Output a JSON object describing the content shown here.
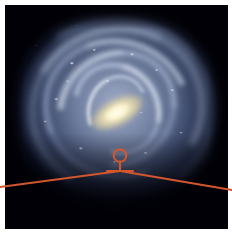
{
  "figure": {
    "name": "milky-way-galaxy-illustration",
    "width": 232,
    "height": 234,
    "background_color": "#ffffff",
    "panel_color": "#000006",
    "caption": ""
  },
  "galaxy": {
    "label": "Milky Way galaxy (face-on artist's impression)",
    "disk_color": "#a8bae0",
    "arm_color": "#dceaff",
    "bulge_color": "#faf0c4",
    "core_color": "#fffff4",
    "center": {
      "x": 116,
      "y": 109
    },
    "disk_radius_x": 104,
    "disk_radius_y": 98,
    "bar_angle_deg": -28,
    "arms": [
      {
        "name": "outer-arm",
        "rotation_deg": 8,
        "opacity": 0.3
      },
      {
        "name": "perseus-arm",
        "rotation_deg": -16,
        "opacity": 0.5
      },
      {
        "name": "outer-sagittarius-arm",
        "rotation_deg": 22,
        "opacity": 0.56
      },
      {
        "name": "sagittarius-arm",
        "rotation_deg": -42,
        "opacity": 0.62
      },
      {
        "name": "scutum-centaurus-arm",
        "rotation_deg": 58,
        "opacity": 0.66
      },
      {
        "name": "norma-arm",
        "rotation_deg": -70,
        "opacity": 0.62
      }
    ]
  },
  "annotation": {
    "marker_color": "#d2562e",
    "marker_label": "",
    "sun_marker": {
      "name": "sun-position-marker",
      "circle": {
        "cx": 120,
        "cy": 155.5,
        "r": 6.3
      },
      "stem": {
        "x": 120,
        "y1": 161.5,
        "y2": 171
      },
      "crossbar": {
        "x1": 107,
        "x2": 133,
        "y": 171
      }
    },
    "sight_lines": [
      {
        "name": "sight-line-left",
        "x1": 120,
        "y1": 171,
        "x2": 0,
        "y2": 187
      },
      {
        "name": "sight-line-right",
        "x1": 120,
        "y1": 171,
        "x2": 232,
        "y2": 190
      }
    ],
    "line_width": 2.1
  }
}
